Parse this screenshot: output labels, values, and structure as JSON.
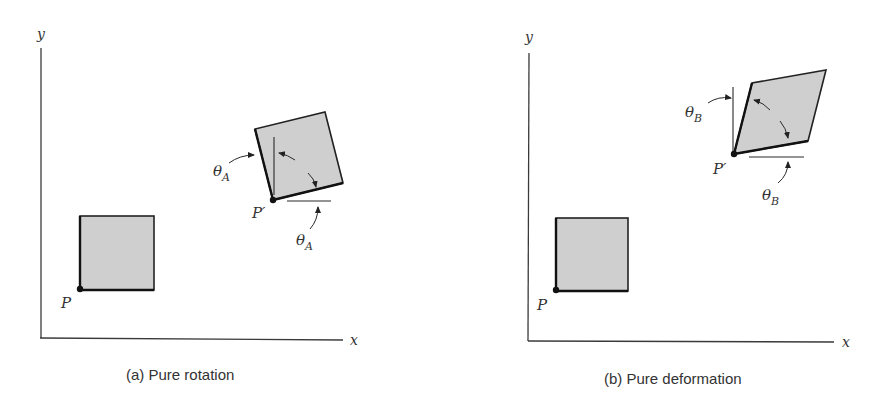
{
  "figure": {
    "panels": [
      {
        "id": "a",
        "caption": "(a)  Pure rotation",
        "axis_labels": {
          "x": "x",
          "y": "y"
        },
        "original_point_label": "P",
        "transformed_point_label": "P′",
        "angle_label_1": "θ",
        "angle_label_1_sub": "A",
        "angle_label_2": "θ",
        "angle_label_2_sub": "A",
        "description": "Square element rotated rigidly by angle θA about P′"
      },
      {
        "id": "b",
        "caption": "(b)  Pure deformation",
        "axis_labels": {
          "x": "x",
          "y": "y"
        },
        "original_point_label": "P",
        "transformed_point_label": "P′",
        "angle_label_1": "θ",
        "angle_label_1_sub": "B",
        "angle_label_2": "θ",
        "angle_label_2_sub": "B",
        "description": "Square element sheared into a rhombus; both sides rotate by θB toward each other"
      }
    ],
    "colors": {
      "shape_fill": "#cfcfcf",
      "stroke": "#222222",
      "text": "#333333",
      "background": "#ffffff"
    }
  }
}
